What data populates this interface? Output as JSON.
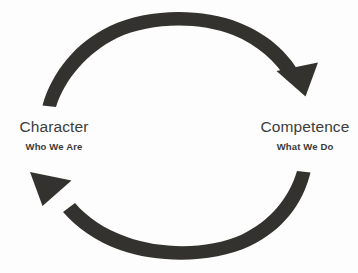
{
  "diagram": {
    "type": "cycle",
    "background_color": "#fdfdfd",
    "arrow_color": "#33322f",
    "title_color": "#3c3c3c",
    "subtitle_color": "#3a3a3a",
    "nodes": [
      {
        "id": "character",
        "title": "Character",
        "subtitle": "Who We Are",
        "position": "left"
      },
      {
        "id": "competence",
        "title": "Competence",
        "subtitle": "What We Do",
        "position": "right"
      }
    ],
    "arrows": [
      {
        "id": "character-to-competence",
        "from": "character",
        "to": "competence",
        "direction": "clockwise-top",
        "style": "tapered-curved"
      },
      {
        "id": "competence-to-character",
        "from": "competence",
        "to": "character",
        "direction": "clockwise-bottom",
        "style": "tapered-curved"
      }
    ]
  }
}
